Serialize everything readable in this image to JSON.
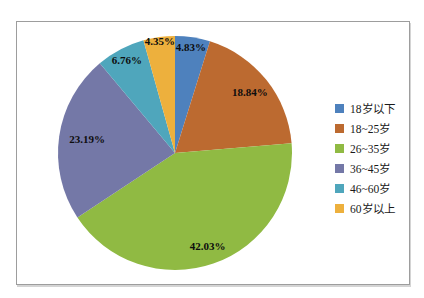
{
  "frame": {
    "border_color": "#9d9d9d",
    "background": "#ffffff"
  },
  "chart_data": {
    "type": "pie",
    "title": "",
    "start_angle_deg": 0,
    "direction": "clockwise",
    "legend_position": "right",
    "categories": [
      "18岁以下",
      "18~25岁",
      "26~35岁",
      "36~45岁",
      "46~60岁",
      "60岁以上"
    ],
    "values": [
      4.83,
      18.84,
      42.03,
      23.19,
      6.76,
      4.35
    ],
    "items": [
      {
        "label": "18岁以下",
        "value": 4.83,
        "pct_label": "4.83%",
        "color": "#4E81BD"
      },
      {
        "label": "18~25岁",
        "value": 18.84,
        "pct_label": "18.84%",
        "color": "#BC6A30"
      },
      {
        "label": "26~35岁",
        "value": 42.03,
        "pct_label": "42.03%",
        "color": "#90BA43"
      },
      {
        "label": "36~45岁",
        "value": 23.19,
        "pct_label": "23.19%",
        "color": "#7478A7"
      },
      {
        "label": "46~60岁",
        "value": 6.76,
        "pct_label": "6.76%",
        "color": "#4FA6BC"
      },
      {
        "label": "60岁以上",
        "value": 4.35,
        "pct_label": "4.35%",
        "color": "#EDB03D"
      }
    ],
    "label_text_color": "#0d0d0d"
  }
}
